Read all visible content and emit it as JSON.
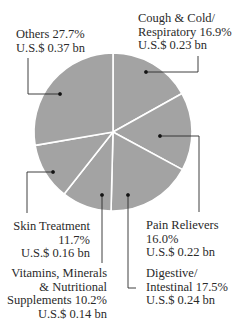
{
  "chart_data": {
    "type": "pie",
    "title": "",
    "unit": "U.S.$ bn",
    "start_angle_deg": 0,
    "direction": "clockwise",
    "slice_color": "#a3a3a3",
    "separator_color": "#ffffff",
    "categories": [
      "Cough & Cold/ Respiratory",
      "Pain Relievers",
      "Digestive/ Intestinal",
      "Vitamins, Minerals & Nutritional Supplements",
      "Skin Treatment",
      "Others"
    ],
    "percent": [
      16.9,
      16.0,
      17.5,
      10.2,
      11.7,
      27.7
    ],
    "values_bn": [
      0.23,
      0.22,
      0.24,
      0.14,
      0.16,
      0.37
    ]
  },
  "labels": {
    "others": {
      "l1": "Others 27.7%",
      "l2": "U.S.$ 0.37 bn"
    },
    "cough": {
      "l1": "Cough & Cold/",
      "l2": "Respiratory  16.9%",
      "l3": "U.S.$ 0.23 bn"
    },
    "pain": {
      "l1": "Pain Relievers",
      "l2": "16.0%",
      "l3": "U.S.$ 0.22 bn"
    },
    "digestive": {
      "l1": "Digestive/",
      "l2": "Intestinal  17.5%",
      "l3": "U.S.$ 0.24 bn"
    },
    "skin": {
      "l1": "Skin Treatment",
      "l2": "11.7%",
      "l3": "U.S.$ 0.16 bn"
    },
    "vitamins": {
      "l1": "Vitamins, Minerals",
      "l2": "& Nutritional",
      "l3": "Supplements 10.2%",
      "l4": "U.S.$ 0.14 bn"
    }
  }
}
